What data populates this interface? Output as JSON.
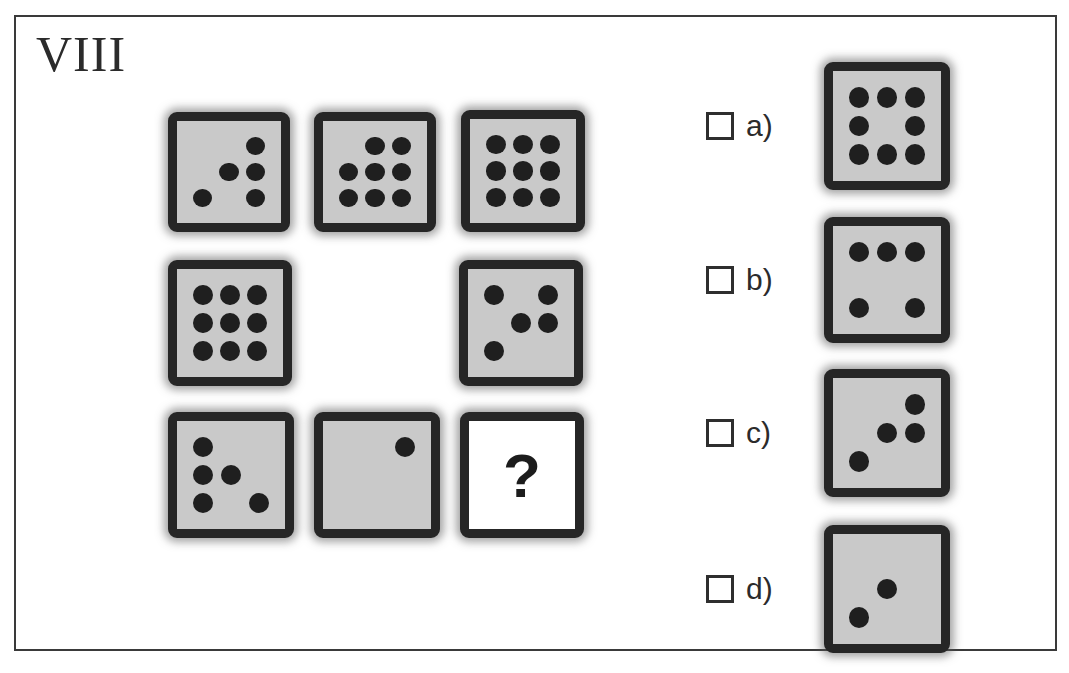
{
  "page": {
    "title": "VIII",
    "question_mark": "?",
    "frame_color": "#3a3a3a",
    "die_body_color": "#c9c9c9",
    "die_border_color": "#262626",
    "pip_color": "#1f1f1f"
  },
  "matrix": {
    "name": "dice-matrix",
    "rows": 3,
    "cols": 3,
    "cells": [
      {
        "id": "cell-r1c1",
        "row": 1,
        "col": 1,
        "type": "die",
        "pip_count": 5,
        "pips": [
          0,
          0,
          1,
          0,
          1,
          1,
          1,
          0,
          1
        ],
        "x": 14,
        "y": 15,
        "w": 122,
        "h": 120
      },
      {
        "id": "cell-r1c2",
        "row": 1,
        "col": 2,
        "type": "die",
        "pip_count": 8,
        "pips": [
          0,
          1,
          1,
          1,
          1,
          1,
          1,
          1,
          1
        ],
        "x": 160,
        "y": 15,
        "w": 122,
        "h": 120
      },
      {
        "id": "cell-r1c3",
        "row": 1,
        "col": 3,
        "type": "die",
        "pip_count": 9,
        "pips": [
          1,
          1,
          1,
          1,
          1,
          1,
          1,
          1,
          1
        ],
        "x": 307,
        "y": 13,
        "w": 124,
        "h": 122
      },
      {
        "id": "cell-r2c1",
        "row": 2,
        "col": 1,
        "type": "die",
        "pip_count": 9,
        "pips": [
          1,
          1,
          1,
          1,
          1,
          1,
          1,
          1,
          1
        ],
        "x": 14,
        "y": 163,
        "w": 124,
        "h": 126
      },
      {
        "id": "cell-r2c2",
        "row": 2,
        "col": 2,
        "type": "empty",
        "pip_count": 0,
        "pips": [
          0,
          0,
          0,
          0,
          0,
          0,
          0,
          0,
          0
        ],
        "x": 160,
        "y": 163,
        "w": 122,
        "h": 126
      },
      {
        "id": "cell-r2c3",
        "row": 2,
        "col": 3,
        "type": "die",
        "pip_count": 5,
        "pips": [
          1,
          0,
          1,
          0,
          1,
          1,
          1,
          0,
          0
        ],
        "x": 305,
        "y": 163,
        "w": 124,
        "h": 126
      },
      {
        "id": "cell-r3c1",
        "row": 3,
        "col": 1,
        "type": "die",
        "pip_count": 5,
        "pips": [
          1,
          0,
          0,
          1,
          1,
          0,
          1,
          0,
          1
        ],
        "x": 14,
        "y": 315,
        "w": 126,
        "h": 126
      },
      {
        "id": "cell-r3c2",
        "row": 3,
        "col": 2,
        "type": "die",
        "pip_count": 1,
        "pips": [
          0,
          0,
          1,
          0,
          0,
          0,
          0,
          0,
          0
        ],
        "x": 160,
        "y": 315,
        "w": 126,
        "h": 126
      },
      {
        "id": "cell-r3c3",
        "row": 3,
        "col": 3,
        "type": "question",
        "pip_count": 0,
        "pips": [
          0,
          0,
          0,
          0,
          0,
          0,
          0,
          0,
          0
        ],
        "x": 306,
        "y": 315,
        "w": 124,
        "h": 126
      }
    ]
  },
  "options": [
    {
      "id": "option-a",
      "label": "a)",
      "checked": false,
      "pip_count": 8,
      "pips": [
        1,
        1,
        1,
        1,
        0,
        1,
        1,
        1,
        1
      ],
      "y": 15,
      "die_x": 118,
      "die_w": 126,
      "die_h": 128
    },
    {
      "id": "option-b",
      "label": "b)",
      "checked": false,
      "pip_count": 5,
      "pips": [
        1,
        1,
        1,
        0,
        0,
        0,
        1,
        0,
        1
      ],
      "y": 170,
      "die_x": 118,
      "die_w": 126,
      "die_h": 126
    },
    {
      "id": "option-c",
      "label": "c)",
      "checked": false,
      "pip_count": 4,
      "pips": [
        0,
        0,
        1,
        0,
        1,
        1,
        1,
        0,
        0
      ],
      "y": 322,
      "die_x": 118,
      "die_w": 126,
      "die_h": 128
    },
    {
      "id": "option-d",
      "label": "d)",
      "checked": false,
      "pip_count": 2,
      "pips": [
        0,
        0,
        0,
        0,
        1,
        0,
        1,
        0,
        0
      ],
      "y": 478,
      "die_x": 118,
      "die_w": 126,
      "die_h": 128
    }
  ]
}
